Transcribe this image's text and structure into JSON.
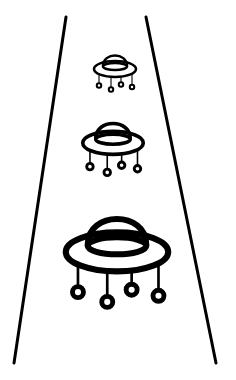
{
  "scene": {
    "description": "Line drawing of three UFOs of increasing size inside a perspective road/beam",
    "background": "#ffffff",
    "stroke": "#000000",
    "icons": [
      "ufo-icon-small",
      "ufo-icon-medium",
      "ufo-icon-large"
    ]
  }
}
